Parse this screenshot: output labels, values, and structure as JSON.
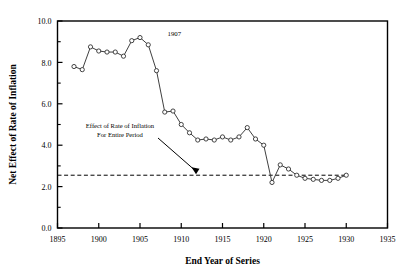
{
  "chart_data": {
    "type": "line",
    "title": "",
    "xlabel": "End Year of Series",
    "ylabel": "Net Effect of Rate of Inflation",
    "xlim": [
      1895,
      1935
    ],
    "ylim": [
      0.0,
      10.0
    ],
    "xticks": [
      1895,
      1900,
      1905,
      1910,
      1915,
      1920,
      1925,
      1930,
      1935
    ],
    "xticklabels": [
      "1895",
      "1900",
      "1905",
      "1910",
      "1915",
      "1920",
      "1925",
      "1930",
      "1935"
    ],
    "yticks": [
      0.0,
      2.0,
      4.0,
      6.0,
      8.0,
      10.0
    ],
    "yticklabels": [
      "0.0",
      "2.0",
      "4.0",
      "6.0",
      "8.0",
      "10.0"
    ],
    "minor_yticks": [
      1.0,
      3.0,
      5.0,
      7.0,
      9.0
    ],
    "grid": false,
    "legend": false,
    "marker": "open-circle",
    "x": [
      1897,
      1898,
      1899,
      1900,
      1901,
      1902,
      1903,
      1904,
      1905,
      1906,
      1907,
      1908,
      1909,
      1910,
      1911,
      1912,
      1913,
      1914,
      1915,
      1916,
      1917,
      1918,
      1919,
      1920,
      1921,
      1922,
      1923,
      1924,
      1925,
      1926,
      1927,
      1928,
      1929,
      1930
    ],
    "values": [
      7.8,
      7.65,
      8.75,
      8.55,
      8.5,
      8.5,
      8.3,
      9.05,
      9.2,
      8.85,
      7.6,
      5.6,
      5.65,
      5.0,
      4.6,
      4.25,
      4.3,
      4.25,
      4.4,
      4.25,
      4.4,
      4.85,
      4.3,
      4.0,
      2.2,
      3.05,
      2.85,
      2.55,
      2.4,
      2.35,
      2.3,
      2.3,
      2.4,
      2.55
    ],
    "reference_line": {
      "label": "Effect of Rate of Inflation For Entire Period",
      "value": 2.55,
      "style": "dashed",
      "x_start": 1895,
      "x_end": 1930
    },
    "annotations": [
      {
        "name": "peak-label",
        "text": "1907",
        "x": 1907,
        "y": 9.2
      },
      {
        "name": "reference-annotation",
        "line1": "Effect of Rate of Inflation",
        "line2": "For Entire Period"
      }
    ]
  },
  "colors": {
    "axis": "#000000",
    "line": "#404040",
    "marker_fill": "#ffffff",
    "marker_stroke": "#303030",
    "reference": "#000000"
  }
}
